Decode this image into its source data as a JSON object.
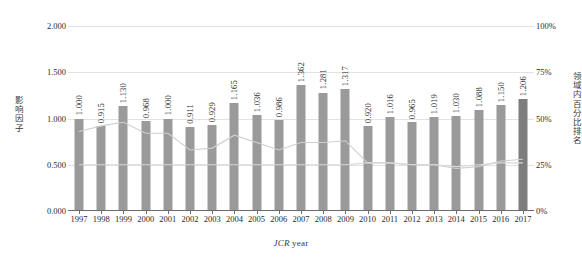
{
  "chart_data": {
    "type": "bar",
    "title": "",
    "xlabel": "JCR year",
    "ylabel": "影响因子",
    "y2label": "领域内百分比排名",
    "categories": [
      "1997",
      "1998",
      "1999",
      "2000",
      "2001",
      "2002",
      "2003",
      "2004",
      "2005",
      "2006",
      "2007",
      "2008",
      "2009",
      "2010",
      "2011",
      "2012",
      "2013",
      "2014",
      "2015",
      "2016",
      "2017"
    ],
    "ylim": [
      0,
      2.0
    ],
    "yticks": [
      "0.000",
      "0.500",
      "1.000",
      "1.500",
      "2.000"
    ],
    "ytick_values": [
      0,
      0.5,
      1.0,
      1.5,
      2.0
    ],
    "y2lim": [
      0,
      100
    ],
    "y2ticks": [
      "0%",
      "25%",
      "50%",
      "75%",
      "100%"
    ],
    "y2tick_values": [
      0,
      25,
      50,
      75,
      100
    ],
    "grid": true,
    "legend": "none",
    "series": [
      {
        "name": "影响因子",
        "type": "bar",
        "axis": "left",
        "color": "#9a9a9a",
        "highlight_color": "#7d7d7d",
        "highlight_index": 20,
        "values": [
          1.0,
          0.915,
          1.13,
          0.968,
          1.0,
          0.911,
          0.929,
          1.165,
          1.036,
          0.986,
          1.362,
          1.281,
          1.317,
          0.92,
          1.016,
          0.965,
          1.019,
          1.03,
          1.088,
          1.15,
          1.206
        ],
        "labels": [
          "1.000",
          "0.915",
          "1.130",
          "0.968",
          "1.000",
          "0.911",
          "0.929",
          "1.165",
          "1.036",
          "0.986",
          "1.362",
          "1.281",
          "1.317",
          "0.920",
          "1.016",
          "0.965",
          "1.019",
          "1.030",
          "1.088",
          "1.150",
          "1.206"
        ]
      },
      {
        "name": "领域内百分比排名 (上线)",
        "type": "line",
        "axis": "right",
        "color": "#cfcfcf",
        "values": [
          43,
          46,
          48,
          42,
          42,
          33,
          34,
          41,
          37,
          33,
          37,
          37,
          38,
          26,
          26,
          25,
          25,
          23,
          24,
          27,
          28
        ]
      },
      {
        "name": "领域内百分比排名 (下线)",
        "type": "line",
        "axis": "right",
        "color": "#d8d8d8",
        "values": [
          25,
          25,
          25,
          25,
          25,
          25,
          25,
          25,
          25,
          25,
          25,
          25,
          25,
          26,
          26,
          25,
          25,
          24,
          25,
          26,
          26
        ]
      }
    ]
  },
  "axes": {
    "y_left_title": "影响因子",
    "y_right_title": "领域内百分比排名",
    "x_title_italic": "JCR",
    "x_title_rest": " year"
  }
}
